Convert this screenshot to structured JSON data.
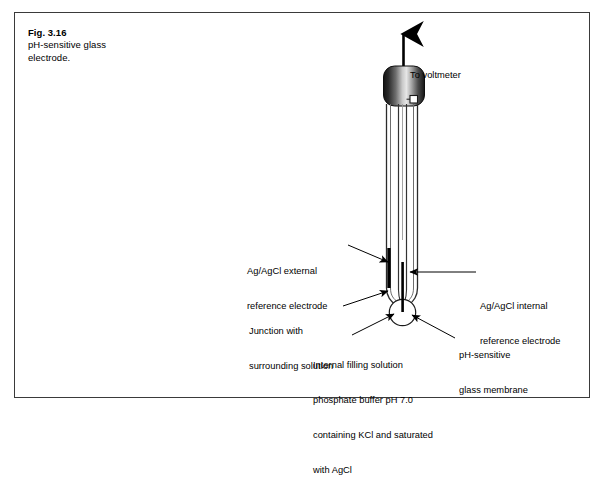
{
  "figure": {
    "caption_title": "Fig. 3.16",
    "caption_line1": "pH-sensitive glass",
    "caption_line2": "electrode.",
    "frame_color": "#3a3a3a",
    "ink_color": "#000000",
    "background_color": "#ffffff"
  },
  "labels": {
    "voltmeter": {
      "text": "To voltmeter"
    },
    "external_reference": {
      "line1": "Ag/AgCl external",
      "line2": "reference electrode"
    },
    "internal_reference": {
      "line1": "Ag/AgCl internal",
      "line2": "reference electrode"
    },
    "junction": {
      "line1": "Junction with",
      "line2": "surrounding solution"
    },
    "filling_solution": {
      "line1": "Internal filling solution",
      "line2": "phosphate buffer pH 7.0",
      "line3": "containing KCl and saturated",
      "line4": "with AgCl"
    },
    "membrane": {
      "line1": "pH-sensitive",
      "line2": "glass membrane"
    }
  },
  "diagram": {
    "cap_label": "electrode-cap",
    "cap_gradient_dark": "#1a1a1a",
    "cap_gradient_light": "#e8e8e8",
    "bulb_label": "glass-membrane-bulb",
    "electrode_bar_label": "electrode-bar"
  }
}
